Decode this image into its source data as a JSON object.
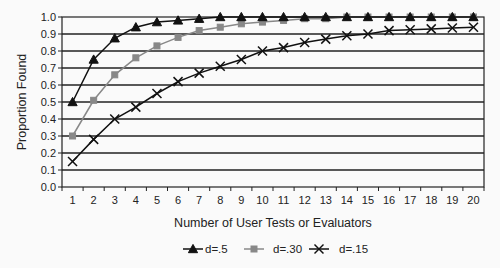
{
  "chart_data": {
    "type": "line",
    "title": "",
    "xlabel": "Number of User Tests or Evaluators",
    "ylabel": "Proportion Found",
    "ylim": [
      0.0,
      1.0
    ],
    "yticks": [
      "0.0",
      "0.1",
      "0.2",
      "0.3",
      "0.4",
      "0.5",
      "0.6",
      "0.7",
      "0.8",
      "0.9",
      "1.0"
    ],
    "grid": true,
    "legend_position": "bottom",
    "categories": [
      1,
      2,
      3,
      4,
      5,
      6,
      7,
      8,
      9,
      10,
      11,
      12,
      13,
      14,
      15,
      16,
      17,
      18,
      19,
      20
    ],
    "series": [
      {
        "name": "d=.5",
        "marker": "triangle",
        "color": "#111111",
        "values": [
          0.5,
          0.75,
          0.875,
          0.94,
          0.97,
          0.98,
          0.99,
          1.0,
          1.0,
          1.0,
          1.0,
          1.0,
          1.0,
          1.0,
          1.0,
          1.0,
          1.0,
          1.0,
          1.0,
          1.0
        ]
      },
      {
        "name": "d=.30",
        "marker": "square",
        "color": "#888888",
        "values": [
          0.3,
          0.51,
          0.66,
          0.76,
          0.83,
          0.88,
          0.92,
          0.94,
          0.96,
          0.97,
          0.98,
          0.99,
          0.99,
          1.0,
          1.0,
          1.0,
          1.0,
          1.0,
          1.0,
          1.0
        ]
      },
      {
        "name": "d=.15",
        "marker": "x",
        "color": "#111111",
        "values": [
          0.15,
          0.28,
          0.4,
          0.47,
          0.55,
          0.62,
          0.67,
          0.71,
          0.75,
          0.8,
          0.82,
          0.85,
          0.87,
          0.89,
          0.9,
          0.92,
          0.925,
          0.93,
          0.935,
          0.94
        ]
      }
    ]
  }
}
